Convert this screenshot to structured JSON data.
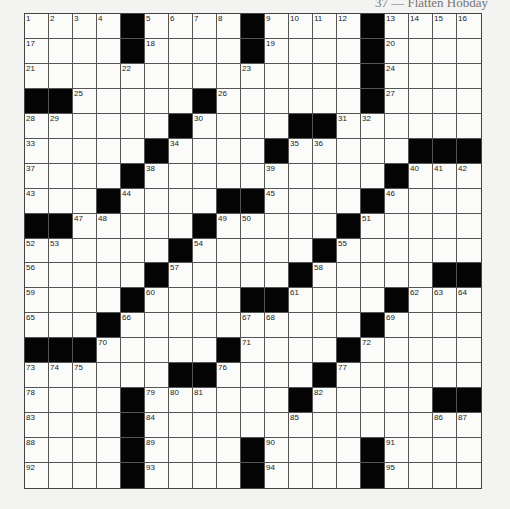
{
  "header": {
    "byline_partial": "37 — Flatten Hobday"
  },
  "puzzle": {
    "rows": 19,
    "cols": 19,
    "colors": {
      "block": "#050505",
      "cell": "#fbfbfa",
      "grid_line": "#555555",
      "background": "#f3f3f1"
    },
    "blocks": [
      [
        0,
        4
      ],
      [
        0,
        9
      ],
      [
        0,
        14
      ],
      [
        1,
        4
      ],
      [
        1,
        9
      ],
      [
        1,
        14
      ],
      [
        2,
        14
      ],
      [
        3,
        0
      ],
      [
        3,
        1
      ],
      [
        3,
        7
      ],
      [
        3,
        14
      ],
      [
        4,
        6
      ],
      [
        4,
        11
      ],
      [
        4,
        12
      ],
      [
        5,
        5
      ],
      [
        5,
        10
      ],
      [
        5,
        16
      ],
      [
        5,
        17
      ],
      [
        5,
        18
      ],
      [
        6,
        4
      ],
      [
        6,
        15
      ],
      [
        7,
        3
      ],
      [
        7,
        8
      ],
      [
        7,
        9
      ],
      [
        7,
        14
      ],
      [
        8,
        0
      ],
      [
        8,
        1
      ],
      [
        8,
        7
      ],
      [
        8,
        13
      ],
      [
        9,
        6
      ],
      [
        9,
        12
      ],
      [
        10,
        5
      ],
      [
        10,
        11
      ],
      [
        10,
        17
      ],
      [
        10,
        18
      ],
      [
        11,
        4
      ],
      [
        11,
        9
      ],
      [
        11,
        10
      ],
      [
        11,
        15
      ],
      [
        12,
        3
      ],
      [
        12,
        14
      ],
      [
        13,
        0
      ],
      [
        13,
        1
      ],
      [
        13,
        2
      ],
      [
        13,
        8
      ],
      [
        13,
        13
      ],
      [
        14,
        6
      ],
      [
        14,
        7
      ],
      [
        14,
        12
      ],
      [
        15,
        4
      ],
      [
        15,
        11
      ],
      [
        15,
        17
      ],
      [
        15,
        18
      ],
      [
        16,
        4
      ],
      [
        17,
        4
      ],
      [
        17,
        9
      ],
      [
        17,
        14
      ],
      [
        18,
        4
      ],
      [
        18,
        9
      ],
      [
        18,
        14
      ]
    ],
    "numbers": [
      [
        0,
        0,
        "1"
      ],
      [
        0,
        1,
        "2"
      ],
      [
        0,
        2,
        "3"
      ],
      [
        0,
        3,
        "4"
      ],
      [
        0,
        5,
        "5"
      ],
      [
        0,
        6,
        "6"
      ],
      [
        0,
        7,
        "7"
      ],
      [
        0,
        8,
        "8"
      ],
      [
        0,
        10,
        "9"
      ],
      [
        0,
        11,
        "10"
      ],
      [
        0,
        12,
        "11"
      ],
      [
        0,
        13,
        "12"
      ],
      [
        0,
        15,
        "13"
      ],
      [
        0,
        16,
        "14"
      ],
      [
        0,
        17,
        "15"
      ],
      [
        0,
        18,
        "16"
      ],
      [
        1,
        0,
        "17"
      ],
      [
        1,
        5,
        "18"
      ],
      [
        1,
        10,
        "19"
      ],
      [
        1,
        15,
        "20"
      ],
      [
        2,
        0,
        "21"
      ],
      [
        2,
        4,
        "22"
      ],
      [
        2,
        9,
        "23"
      ],
      [
        2,
        15,
        "24"
      ],
      [
        3,
        2,
        "25"
      ],
      [
        3,
        8,
        "26"
      ],
      [
        3,
        15,
        "27"
      ],
      [
        4,
        0,
        "28"
      ],
      [
        4,
        1,
        "29"
      ],
      [
        4,
        7,
        "30"
      ],
      [
        4,
        13,
        "31"
      ],
      [
        4,
        14,
        "32"
      ],
      [
        5,
        0,
        "33"
      ],
      [
        5,
        6,
        "34"
      ],
      [
        5,
        11,
        "35"
      ],
      [
        5,
        12,
        "36"
      ],
      [
        6,
        0,
        "37"
      ],
      [
        6,
        5,
        "38"
      ],
      [
        6,
        10,
        "39"
      ],
      [
        6,
        16,
        "40"
      ],
      [
        6,
        17,
        "41"
      ],
      [
        6,
        18,
        "42"
      ],
      [
        7,
        0,
        "43"
      ],
      [
        7,
        4,
        "44"
      ],
      [
        7,
        10,
        "45"
      ],
      [
        7,
        15,
        "46"
      ],
      [
        8,
        2,
        "47"
      ],
      [
        8,
        3,
        "48"
      ],
      [
        8,
        8,
        "49"
      ],
      [
        8,
        9,
        "50"
      ],
      [
        8,
        14,
        "51"
      ],
      [
        9,
        0,
        "52"
      ],
      [
        9,
        1,
        "53"
      ],
      [
        9,
        7,
        "54"
      ],
      [
        9,
        13,
        "55"
      ],
      [
        10,
        0,
        "56"
      ],
      [
        10,
        6,
        "57"
      ],
      [
        10,
        12,
        "58"
      ],
      [
        11,
        0,
        "59"
      ],
      [
        11,
        5,
        "60"
      ],
      [
        11,
        11,
        "61"
      ],
      [
        11,
        16,
        "62"
      ],
      [
        11,
        17,
        "63"
      ],
      [
        11,
        18,
        "64"
      ],
      [
        12,
        0,
        "65"
      ],
      [
        12,
        4,
        "66"
      ],
      [
        12,
        9,
        "67"
      ],
      [
        12,
        10,
        "68"
      ],
      [
        12,
        15,
        "69"
      ],
      [
        13,
        3,
        "70"
      ],
      [
        13,
        9,
        "71"
      ],
      [
        13,
        14,
        "72"
      ],
      [
        14,
        0,
        "73"
      ],
      [
        14,
        1,
        "74"
      ],
      [
        14,
        2,
        "75"
      ],
      [
        14,
        8,
        "76"
      ],
      [
        14,
        13,
        "77"
      ],
      [
        15,
        0,
        "78"
      ],
      [
        15,
        5,
        "79"
      ],
      [
        15,
        6,
        "80"
      ],
      [
        15,
        7,
        "81"
      ],
      [
        15,
        12,
        "82"
      ],
      [
        16,
        0,
        "83"
      ],
      [
        16,
        5,
        "84"
      ],
      [
        16,
        11,
        "85"
      ],
      [
        16,
        17,
        "86"
      ],
      [
        16,
        18,
        "87"
      ],
      [
        17,
        0,
        "88"
      ],
      [
        17,
        5,
        "89"
      ],
      [
        17,
        10,
        "90"
      ],
      [
        17,
        15,
        "91"
      ],
      [
        18,
        0,
        "92"
      ],
      [
        18,
        5,
        "93"
      ],
      [
        18,
        10,
        "94"
      ],
      [
        18,
        15,
        "95"
      ]
    ]
  }
}
